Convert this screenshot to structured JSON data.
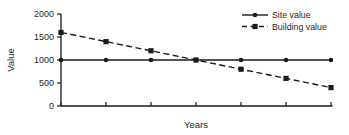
{
  "chart_data": {
    "type": "line",
    "title": "",
    "xlabel": "Years",
    "ylabel": "Value",
    "x": [
      0,
      1,
      2,
      3,
      4,
      5,
      6
    ],
    "x_tick_labels": [
      "",
      "",
      "",
      "",
      "",
      "",
      ""
    ],
    "yticks": [
      0,
      500,
      1000,
      1500,
      2000
    ],
    "ylim": [
      0,
      2000
    ],
    "grid": false,
    "legend_position": "top-right",
    "line_color": "#1a1a1a",
    "background_color": "#ffffff",
    "series": [
      {
        "name": "Site value",
        "style": "solid",
        "marker": "circle",
        "values": [
          1000,
          1000,
          1000,
          1000,
          1000,
          1000,
          1000
        ]
      },
      {
        "name": "Building value",
        "style": "dashed",
        "marker": "square",
        "values": [
          1600,
          1400,
          1200,
          1000,
          800,
          600,
          400
        ]
      }
    ]
  }
}
